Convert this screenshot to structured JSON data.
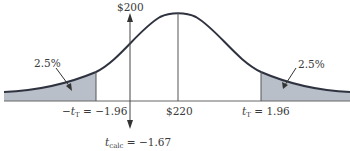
{
  "diagram": {
    "title": "",
    "type": "normal distribution curve, two-tailed hypothesis test",
    "labels": {
      "top_value": "$200",
      "left_tail_pct": "2.5%",
      "right_tail_pct": "2.5%",
      "left_critical_prefix": "−t",
      "left_critical_sub": "T",
      "left_critical_value": " = −1.96",
      "mean_label": "$220",
      "right_critical_prefix": "t",
      "right_critical_sub": "T",
      "right_critical_value": " = 1.96",
      "calc_prefix": "t",
      "calc_sub": "calc",
      "calc_value": " = −1.67"
    },
    "colors": {
      "curve": "#2f3340",
      "shade": "#b9bfc8",
      "line": "#555555",
      "text": "#3a3a3a"
    }
  }
}
